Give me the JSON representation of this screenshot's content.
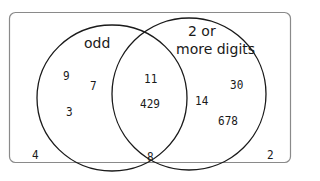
{
  "diagram": {
    "type": "venn",
    "colors": {
      "border": "#8a8a8a",
      "circle": "#1a1a1a",
      "text": "#1a1a1a",
      "background": "#ffffff"
    },
    "sets": [
      {
        "title": "odd",
        "only_elements": [
          "9",
          "7",
          "3"
        ]
      },
      {
        "title_line1": "2 or",
        "title_line2": "more digits",
        "only_elements": [
          "30",
          "14",
          "678"
        ]
      }
    ],
    "intersection": [
      "11",
      "429"
    ],
    "outside": [
      "4",
      "8",
      "2"
    ]
  }
}
